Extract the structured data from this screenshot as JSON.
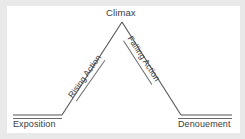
{
  "diagram": {
    "type": "freytag-pyramid",
    "line_color": "#555555",
    "text_color": "#3b3b3b",
    "background_color": "#ffffff",
    "labels": {
      "climax": "Climax",
      "rising_action": "Rising Action",
      "falling_action": "Falling Action",
      "exposition": "Exposition",
      "denouement": "Denouement"
    },
    "geometry": {
      "apex": [
        122,
        22
      ],
      "left_base_start": [
        13,
        115
      ],
      "left_base_end": [
        62,
        115
      ],
      "right_base_start": [
        181,
        115
      ],
      "right_base_end": [
        232,
        115
      ]
    }
  }
}
